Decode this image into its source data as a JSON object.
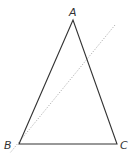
{
  "diagram": {
    "type": "triangle-with-line",
    "stroke_color": "#333333",
    "dotted_color": "#9a9a9a",
    "vertices": [
      {
        "label": "A",
        "x": 73,
        "y": 20
      },
      {
        "label": "B",
        "x": 19,
        "y": 144
      },
      {
        "label": "C",
        "x": 117,
        "y": 144
      }
    ],
    "labels": {
      "A": "A",
      "B": "B",
      "C": "C"
    },
    "dotted_line": {
      "x1": 115,
      "y1": 25,
      "x2": 10,
      "y2": 153
    }
  }
}
